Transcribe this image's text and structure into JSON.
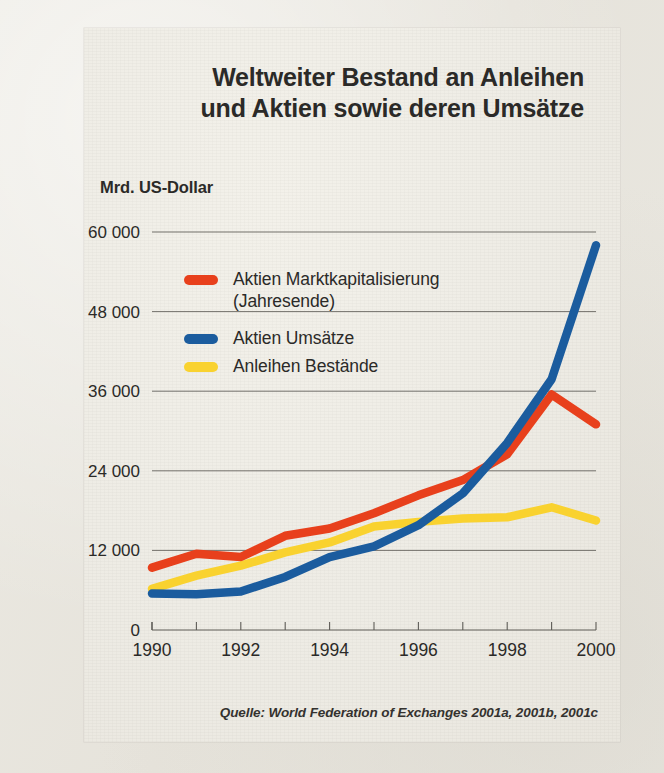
{
  "title": {
    "line1": "Weltweiter Bestand an Anleihen",
    "line2": "und Aktien sowie deren Umsätze"
  },
  "axis_unit_label": "Mrd. US-Dollar",
  "source_note": "Quelle: World Federation of Exchanges 2001a, 2001b, 2001c",
  "colors": {
    "red": "#E8401C",
    "blue": "#1B5C9E",
    "yellow": "#F9D22F",
    "text": "#2B2A28",
    "axis": "#5E5C57",
    "panel": "#EEECE5"
  },
  "legend": [
    {
      "name": "legend-aktien-marktkapitalisierung",
      "color": "#E8401C",
      "line1": "Aktien Marktkapitalisierung",
      "line2": "(Jahresende)"
    },
    {
      "name": "legend-aktien-umsaetze",
      "color": "#1B5C9E",
      "line1": "Aktien Umsätze",
      "line2": ""
    },
    {
      "name": "legend-anleihen-bestaende",
      "color": "#F9D22F",
      "line1": "Anleihen Bestände",
      "line2": ""
    }
  ],
  "chart_data": {
    "type": "line",
    "title": "Weltweiter Bestand an Anleihen und Aktien sowie deren Umsätze",
    "xlabel": "",
    "ylabel": "Mrd. US-Dollar",
    "x": [
      1990,
      1991,
      1992,
      1993,
      1994,
      1995,
      1996,
      1997,
      1998,
      1999,
      2000
    ],
    "xlim": [
      1990,
      2000
    ],
    "ylim": [
      0,
      60000
    ],
    "xticks_major": [
      1990,
      1992,
      1994,
      1996,
      1998,
      2000
    ],
    "xticks_minor": [
      1991,
      1993,
      1995,
      1997,
      1999
    ],
    "xtick_labels": [
      "1990",
      "1992",
      "1994",
      "1996",
      "1998",
      "2000"
    ],
    "yticks": [
      0,
      12000,
      24000,
      36000,
      48000,
      60000
    ],
    "ytick_labels": [
      "0",
      "12 000",
      "24 000",
      "36 000",
      "48 000",
      "60 000"
    ],
    "grid": "horizontal",
    "legend_position": "upper-left-inside",
    "series": [
      {
        "name": "Aktien Marktkapitalisierung (Jahresende)",
        "color": "#E8401C",
        "values": [
          9400,
          11500,
          11000,
          14200,
          15300,
          17600,
          20300,
          22600,
          26500,
          35500,
          31000
        ]
      },
      {
        "name": "Aktien Umsätze",
        "color": "#1B5C9E",
        "values": [
          5500,
          5400,
          5800,
          8000,
          11000,
          12600,
          15800,
          20600,
          28200,
          37800,
          58000
        ]
      },
      {
        "name": "Anleihen Bestände",
        "color": "#F9D22F",
        "values": [
          6200,
          8200,
          9700,
          11700,
          13200,
          15600,
          16300,
          16800,
          17000,
          18500,
          16500
        ]
      }
    ]
  }
}
